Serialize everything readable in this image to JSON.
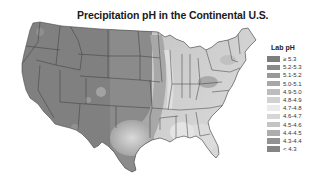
{
  "title": "Precipitation pH in the Continental U.S.",
  "legend": {
    "title": "Lab pH",
    "items": [
      {
        "label": "≥ 5.3",
        "color": "#7d7d7d"
      },
      {
        "label": "5.2-5.3",
        "color": "#8a8a8a"
      },
      {
        "label": "5.1-5.2",
        "color": "#999999"
      },
      {
        "label": "5.0-5.1",
        "color": "#a7a7a7"
      },
      {
        "label": "4.9-5.0",
        "color": "#bdbdbd"
      },
      {
        "label": "4.8-4.9",
        "color": "#d2d2d2"
      },
      {
        "label": "4.7-4.8",
        "color": "#ebebeb"
      },
      {
        "label": "4.6-4.7",
        "color": "#d6d6d6"
      },
      {
        "label": "4.5-4.6",
        "color": "#c4c4c4"
      },
      {
        "label": "4.4-4.5",
        "color": "#adadad"
      },
      {
        "label": "4.3-4.4",
        "color": "#929292"
      },
      {
        "label": "< 4.3",
        "color": "#858585"
      }
    ]
  },
  "map": {
    "region": "Continental U.S.",
    "colors": {
      "west": "#808080",
      "plains": "#8e8e8e",
      "texas": "#b5b5b5",
      "midwest": "#c8c8c8",
      "southeast": "#d9d9d9",
      "northeast": "#bdbdbd",
      "border": "#3a3a3a",
      "light_band": "#e6e6e6"
    }
  }
}
